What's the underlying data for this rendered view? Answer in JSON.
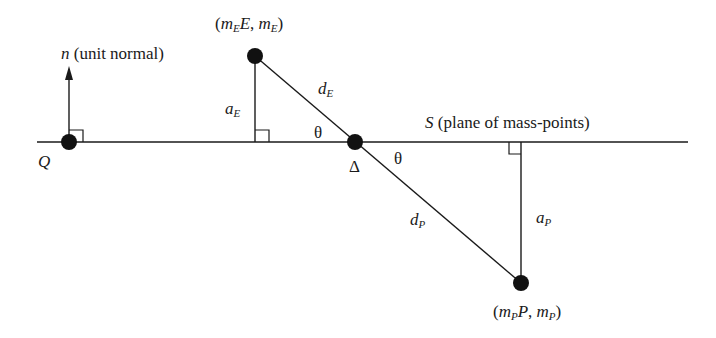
{
  "diagram": {
    "colors": {
      "stroke": "#1a1a1a",
      "point": "#111111",
      "background": "#ffffff"
    },
    "labels": {
      "normal_var": "n",
      "normal_text": "(unit normal)",
      "plane_var": "S",
      "plane_text": "(plane of mass-points)",
      "point_q": "Q",
      "point_delta": "Δ",
      "theta": "θ",
      "e_coord": {
        "open": "(",
        "m": "m",
        "sub": "E",
        "var": "E",
        "sep": ", ",
        "m2": "m",
        "sub2": "E",
        "close": ")"
      },
      "p_coord": {
        "open": "(",
        "m": "m",
        "sub": "P",
        "var": "P",
        "sep": ", ",
        "m2": "m",
        "sub2": "P",
        "close": ")"
      },
      "a_e": {
        "base": "a",
        "sub": "E"
      },
      "a_p": {
        "base": "a",
        "sub": "P"
      },
      "d_e": {
        "base": "d",
        "sub": "E"
      },
      "d_p": {
        "base": "d",
        "sub": "P"
      }
    },
    "points": [
      {
        "name": "Q",
        "x": 69,
        "y": 142
      },
      {
        "name": "E",
        "x": 255,
        "y": 56
      },
      {
        "name": "Delta",
        "x": 355,
        "y": 142
      },
      {
        "name": "P",
        "x": 521,
        "y": 283
      }
    ]
  }
}
